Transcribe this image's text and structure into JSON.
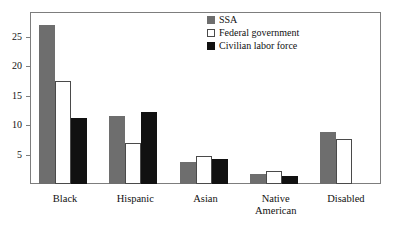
{
  "chart_data": {
    "type": "bar",
    "title": "",
    "subtitle": "",
    "xlabel": "",
    "ylabel": "",
    "categories": [
      "Black",
      "Hispanic",
      "Asian",
      "Native American",
      "Disabled"
    ],
    "category_lines": [
      [
        "Black"
      ],
      [
        "Hispanic"
      ],
      [
        "Asian"
      ],
      [
        "Native",
        "American"
      ],
      [
        "Disabled"
      ]
    ],
    "series": [
      {
        "name": "SSA",
        "color": "#6e6e6e",
        "values": [
          27.0,
          11.5,
          3.7,
          1.7,
          8.8
        ]
      },
      {
        "name": "Federal government",
        "color": "#ffffff",
        "values": [
          17.5,
          7.0,
          4.8,
          2.2,
          7.7
        ]
      },
      {
        "name": "Civilian labor force",
        "color": "#111111",
        "values": [
          11.2,
          12.2,
          4.2,
          1.3,
          null
        ]
      }
    ],
    "ylim": [
      0,
      29
    ],
    "yticks": [
      5,
      10,
      15,
      20,
      25
    ],
    "ytick_labels": [
      "5",
      "10",
      "15",
      "20",
      "25"
    ],
    "grid": false,
    "legend_position": "top-right",
    "axis_color": "#7d7d7d"
  },
  "legend": {
    "entries": [
      {
        "label": "SSA",
        "swatch": "ssa"
      },
      {
        "label": "Federal government",
        "swatch": "fed"
      },
      {
        "label": "Civilian labor force",
        "swatch": "clf"
      }
    ]
  }
}
